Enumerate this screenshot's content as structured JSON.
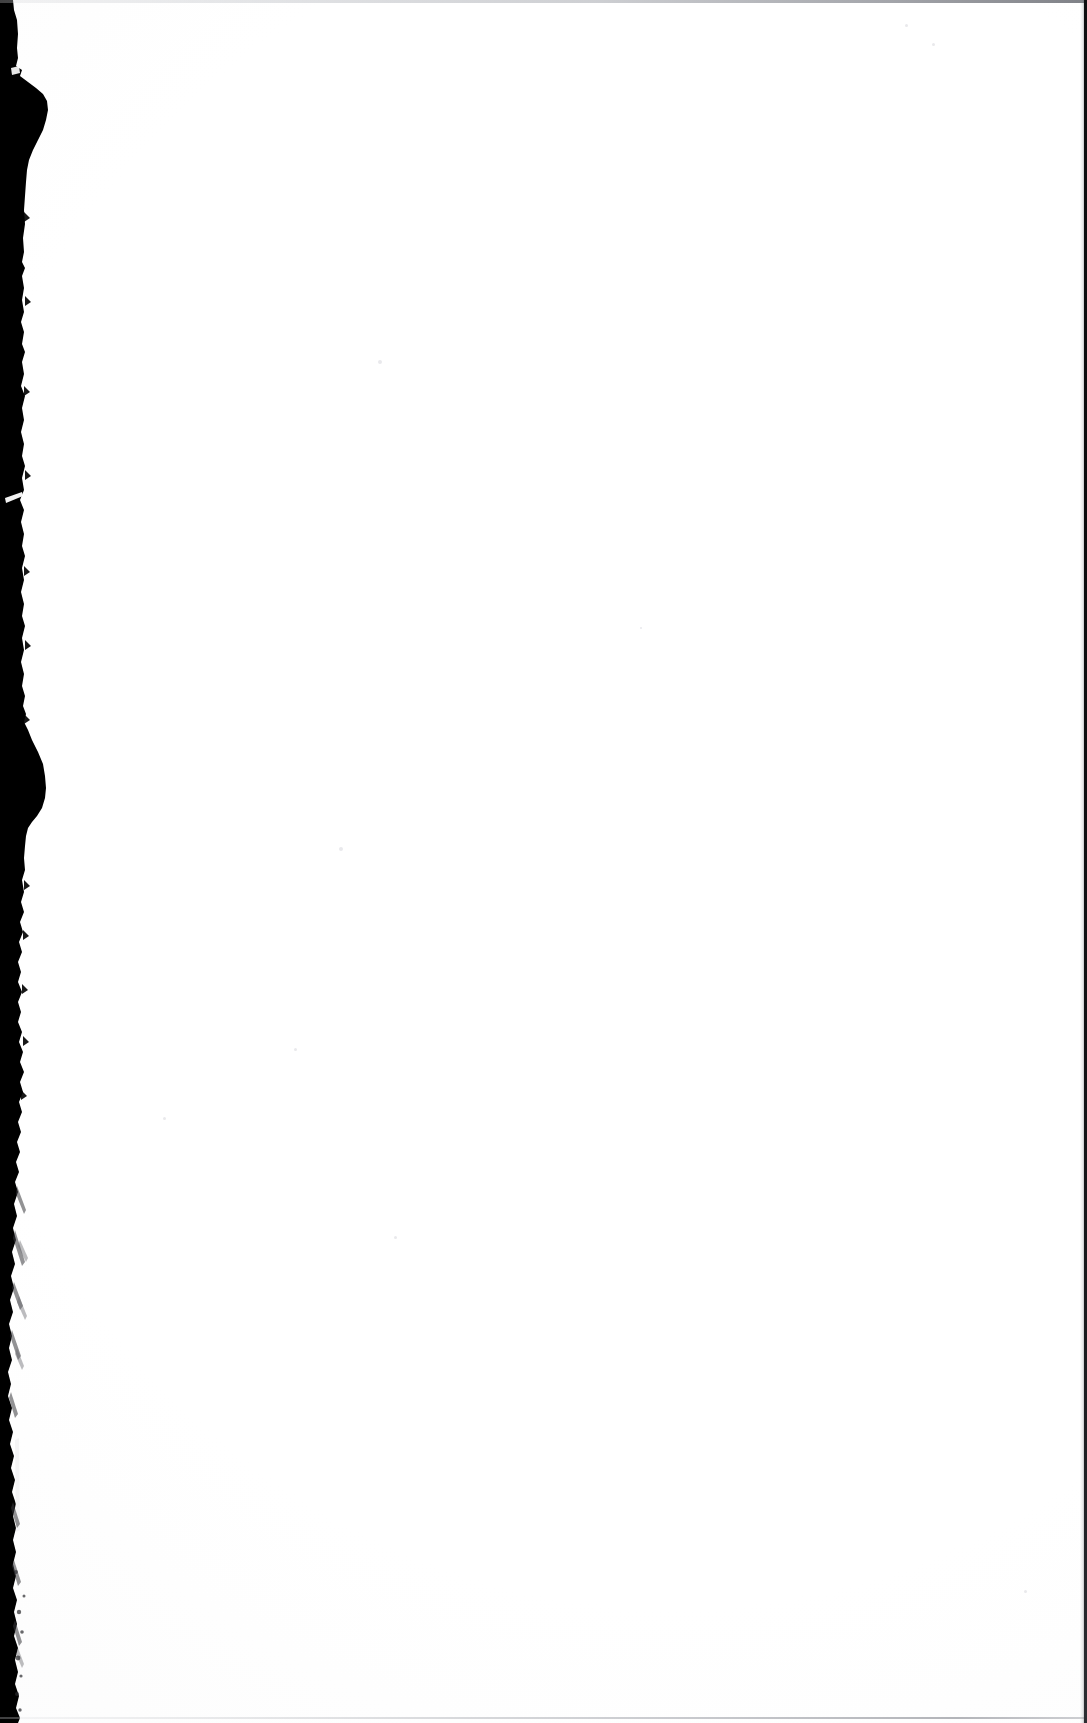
{
  "document": {
    "kind": "scanned-page-image",
    "page_label": "",
    "visible_text": "",
    "has_printed_text": false,
    "has_illustration": false,
    "description": "Blank scanned book page with dark gutter shadow along the left edge"
  },
  "canvas": {
    "width": 1087,
    "height": 1723
  },
  "colors": {
    "page_background": "#fefefe",
    "gutter_shadow": "#000000",
    "scan_edge_right": "#0d0d0f",
    "scan_edge_top": "#babcc1",
    "scan_edge_bottom": "#b2b4ba",
    "speck": "#e9e9ec"
  },
  "regions": {
    "gutter": {
      "name": "gutter-shadow",
      "side": "left",
      "min_width_px": 12,
      "max_width_px": 48,
      "edge_texture": "ragged-fibrous"
    },
    "page_field": {
      "name": "blank-page-field",
      "content": ""
    },
    "scan_frame": {
      "top_line": true,
      "right_line": true,
      "bottom_line": true,
      "left_line": false
    }
  },
  "specks": [
    {
      "x": 378,
      "y": 360,
      "size": 4
    },
    {
      "x": 339,
      "y": 847,
      "size": 4
    },
    {
      "x": 163,
      "y": 1117,
      "size": 3
    },
    {
      "x": 394,
      "y": 1236,
      "size": 3
    },
    {
      "x": 253,
      "y": 1766,
      "size": 2
    },
    {
      "x": 932,
      "y": 43,
      "size": 3
    },
    {
      "x": 905,
      "y": 24,
      "size": 3
    },
    {
      "x": 640,
      "y": 627,
      "size": 2
    },
    {
      "x": 1024,
      "y": 1590,
      "size": 3
    },
    {
      "x": 294,
      "y": 1048,
      "size": 3
    }
  ]
}
